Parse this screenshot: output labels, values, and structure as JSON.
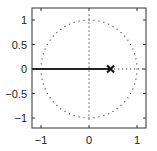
{
  "chart_data": {
    "type": "scatter",
    "title": "",
    "xlabel": "",
    "ylabel": "",
    "xlim": [
      -1.2,
      1.2
    ],
    "ylim": [
      -1.2,
      1.2
    ],
    "grid": false,
    "legend": null,
    "x_ticks": [
      -1,
      0,
      1
    ],
    "x_tick_labels": [
      "−1",
      "0",
      "1"
    ],
    "y_ticks": [
      1,
      0.5,
      0,
      -0.5,
      -1
    ],
    "y_tick_labels": [
      "1",
      "0.5",
      "0",
      "−0.5",
      "−1"
    ],
    "series": [
      {
        "name": "unit-circle",
        "style": "dotted",
        "shape": "circle",
        "center": [
          0,
          0
        ],
        "radius": 1
      },
      {
        "name": "imaginary-axis",
        "style": "dotted",
        "x": [
          0,
          0
        ],
        "y": [
          -1.1,
          1.1
        ]
      },
      {
        "name": "real-axis-right",
        "style": "dotted",
        "x": [
          0.45,
          1.2
        ],
        "y": [
          0,
          0
        ]
      },
      {
        "name": "locus",
        "style": "solid",
        "x": [
          -1.2,
          0.45
        ],
        "y": [
          0,
          0
        ]
      },
      {
        "name": "pole",
        "marker": "x",
        "x": [
          0.45
        ],
        "y": [
          0
        ]
      }
    ],
    "annotations": []
  },
  "colors": {
    "axis": "#333333",
    "locus": "#222222",
    "dots": "#555555",
    "marker": "#111111"
  }
}
